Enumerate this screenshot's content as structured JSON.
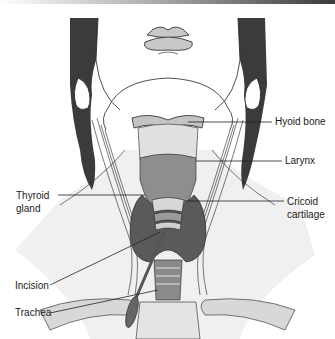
{
  "figure": {
    "labels": {
      "hyoid_bone": "Hyoid bone",
      "larynx": "Larynx",
      "thyroid_line1": "Thyroid",
      "thyroid_line2": "gland",
      "cricoid_line1": "Cricoid",
      "cricoid_line2": "cartilage",
      "incision": "Incision",
      "trachea": "Trachea"
    },
    "colors": {
      "hair": "#3b3b3b",
      "skin": "#ffffff",
      "line": "#222222",
      "lips": "#c8c8c8",
      "hyoid": "#c4c4c4",
      "larynx": "#8e8e8e",
      "thyroid": "#5a5a5a",
      "trachea_rings": "#9a9a9a",
      "shadow": "#e6e6e6",
      "clavicle": "#d8d8d8"
    }
  }
}
